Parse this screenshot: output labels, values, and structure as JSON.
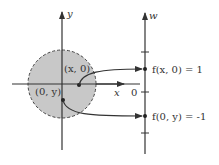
{
  "diagram": {
    "left_plane": {
      "x_axis_label": "x",
      "y_axis_label": "y",
      "disk": {
        "fill": "#c8c8c8",
        "stroke": "#444444",
        "style": "dashed"
      },
      "points": [
        {
          "label": "(x, 0)",
          "location": "on positive x-axis inside disk"
        },
        {
          "label": "(0, y)",
          "location": "on negative y-axis inside disk"
        }
      ]
    },
    "right_axis": {
      "axis_label": "w",
      "zero_label": "0",
      "points": [
        {
          "label": "f(x, 0) = 1",
          "value": 1
        },
        {
          "label": "f(0, y) = -1",
          "value": -1
        }
      ]
    },
    "arrows": [
      {
        "from": "(x, 0)",
        "to": "f(x, 0) = 1"
      },
      {
        "from": "(0, y)",
        "to": "f(0, y) = -1"
      }
    ]
  }
}
